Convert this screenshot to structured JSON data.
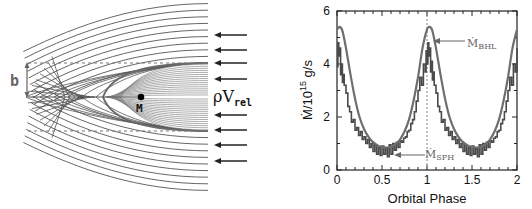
{
  "figure": {
    "left_panel": {
      "title": "Bondi-Hoyle-Lyttleton accretion flow schematic",
      "impact_parameter_label": "b",
      "mass_label": "M",
      "flow_label_base": "ρV",
      "flow_label_sub": "rel",
      "arrow_count": 8,
      "colors": {
        "streamline": "#555555",
        "inner_streamline": "#8a8a8a",
        "separatrix": "#6a6a6a",
        "dashed": "#777777",
        "arrow": "#222222",
        "dot": "#000000"
      }
    },
    "right_panel": {
      "ylabel_text": "Ṁ/10",
      "ylabel_exp": "15",
      "ylabel_unit": " g/s",
      "xlabel": "Orbital Phase",
      "annotation_bhl_base": "Ṁ",
      "annotation_bhl_sub": "BHL",
      "annotation_sph_base": "Ṁ",
      "annotation_sph_sub": "SPH"
    }
  },
  "chart_data": {
    "type": "line",
    "title": "",
    "xlabel": "Orbital Phase",
    "ylabel": "Ṁ/10^15 g/s",
    "xlim": [
      0,
      2
    ],
    "ylim": [
      0,
      6
    ],
    "xticks": [
      0,
      0.5,
      1,
      1.5,
      2
    ],
    "xtick_labels": [
      "0",
      "0.5",
      "1",
      "1.5",
      "2"
    ],
    "yticks": [
      0,
      2,
      4,
      6
    ],
    "ytick_labels": [
      "0",
      "2",
      "4",
      "6"
    ],
    "grid": false,
    "reference_line": {
      "x": 1,
      "style": "dashed"
    },
    "annotations": [
      {
        "text": "Ṁ_BHL",
        "x": 1.3,
        "y": 4.8,
        "arrow_to": [
          1.05,
          4.8
        ]
      },
      {
        "text": "Ṁ_SPH",
        "x": 1.02,
        "y": 0.45,
        "arrow_to": [
          0.62,
          0.45
        ]
      }
    ],
    "series": [
      {
        "name": "Ṁ_BHL",
        "style": "smooth",
        "color": "#6e6e6e",
        "x": [
          0,
          0.03,
          0.06,
          0.1,
          0.15,
          0.2,
          0.25,
          0.3,
          0.35,
          0.4,
          0.45,
          0.5,
          0.55,
          0.6,
          0.65,
          0.7,
          0.75,
          0.8,
          0.85,
          0.9,
          0.95,
          1.0,
          1.03,
          1.06,
          1.1,
          1.15,
          1.2,
          1.25,
          1.3,
          1.35,
          1.4,
          1.45,
          1.5,
          1.55,
          1.6,
          1.65,
          1.7,
          1.75,
          1.8,
          1.85,
          1.9,
          1.95,
          2.0
        ],
        "y": [
          5.3,
          5.4,
          5.25,
          4.6,
          3.6,
          2.7,
          2.0,
          1.55,
          1.25,
          1.05,
          0.93,
          0.87,
          0.85,
          0.88,
          0.98,
          1.15,
          1.45,
          1.9,
          2.6,
          3.5,
          4.6,
          5.3,
          5.4,
          5.25,
          4.6,
          3.6,
          2.7,
          2.0,
          1.55,
          1.25,
          1.05,
          0.93,
          0.87,
          0.85,
          0.88,
          0.98,
          1.15,
          1.45,
          1.9,
          2.6,
          3.5,
          4.6,
          5.3
        ]
      },
      {
        "name": "Ṁ_SPH",
        "style": "noisy-step",
        "color": "#4a4a4a",
        "x": [
          0,
          0.01,
          0.02,
          0.03,
          0.04,
          0.05,
          0.06,
          0.07,
          0.08,
          0.1,
          0.12,
          0.14,
          0.16,
          0.18,
          0.2,
          0.22,
          0.24,
          0.26,
          0.28,
          0.3,
          0.32,
          0.34,
          0.36,
          0.38,
          0.4,
          0.42,
          0.44,
          0.46,
          0.48,
          0.5,
          0.52,
          0.54,
          0.56,
          0.58,
          0.6,
          0.62,
          0.64,
          0.66,
          0.68,
          0.7,
          0.72,
          0.74,
          0.76,
          0.78,
          0.8,
          0.82,
          0.84,
          0.86,
          0.88,
          0.9,
          0.92,
          0.94,
          0.96,
          0.98,
          0.99,
          1.0,
          1.01,
          1.02,
          1.03,
          1.04,
          1.05,
          1.06,
          1.07,
          1.08,
          1.1,
          1.12,
          1.14,
          1.16,
          1.18,
          1.2,
          1.22,
          1.24,
          1.26,
          1.28,
          1.3,
          1.32,
          1.34,
          1.36,
          1.38,
          1.4,
          1.42,
          1.44,
          1.46,
          1.48,
          1.5,
          1.52,
          1.54,
          1.56,
          1.58,
          1.6,
          1.62,
          1.64,
          1.66,
          1.68,
          1.7,
          1.72,
          1.74,
          1.76,
          1.78,
          1.8,
          1.82,
          1.84,
          1.86,
          1.88,
          1.9,
          1.92,
          1.94,
          1.96,
          1.98,
          2.0
        ],
        "y": [
          3.9,
          4.8,
          4.3,
          4.6,
          3.6,
          4.0,
          3.3,
          3.6,
          3.2,
          2.9,
          2.4,
          2.2,
          1.8,
          1.9,
          1.5,
          1.6,
          1.3,
          1.45,
          1.15,
          1.25,
          1.0,
          1.15,
          0.85,
          1.0,
          0.7,
          0.95,
          0.6,
          0.85,
          0.55,
          0.9,
          0.6,
          0.8,
          0.5,
          0.95,
          0.6,
          1.0,
          0.75,
          1.05,
          0.85,
          1.1,
          1.05,
          1.2,
          1.25,
          1.45,
          1.5,
          1.75,
          1.9,
          2.2,
          2.6,
          3.0,
          3.5,
          3.2,
          4.0,
          3.7,
          4.5,
          4.0,
          4.8,
          4.3,
          4.6,
          3.7,
          4.1,
          3.4,
          3.7,
          3.2,
          2.9,
          2.4,
          2.2,
          1.8,
          1.9,
          1.5,
          1.6,
          1.3,
          1.45,
          1.15,
          1.25,
          1.0,
          1.15,
          0.85,
          1.0,
          0.7,
          0.95,
          0.6,
          0.85,
          0.55,
          0.9,
          0.6,
          0.8,
          0.5,
          0.95,
          0.6,
          1.0,
          0.75,
          1.05,
          0.85,
          1.1,
          1.05,
          1.2,
          1.25,
          1.45,
          1.5,
          1.75,
          1.9,
          2.2,
          2.6,
          3.0,
          3.5,
          3.2,
          4.0,
          3.7,
          4.6
        ]
      }
    ]
  }
}
